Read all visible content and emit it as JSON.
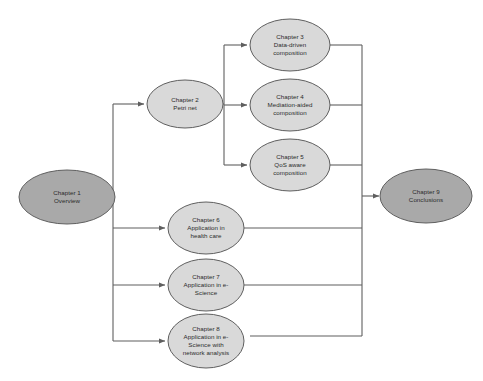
{
  "diagram": {
    "type": "flowchart",
    "background_color": "#ffffff",
    "line_color": "#5f5f5f",
    "text_color": "#2b2b2b",
    "colors": {
      "node_fill_dark": "#a9a9a9",
      "node_fill_light": "#d9d9d9",
      "node_stroke": "#5f5f5f"
    },
    "nodes": [
      {
        "id": "chapter-1",
        "lines": [
          "Chapter 1",
          "Overview"
        ],
        "fill": "#a9a9a9",
        "cx": 67,
        "cy": 197,
        "rx": 48,
        "ry": 27
      },
      {
        "id": "chapter-2",
        "lines": [
          "Chapter 2",
          "Petri net"
        ],
        "fill": "#d9d9d9",
        "cx": 185,
        "cy": 104,
        "rx": 38,
        "ry": 24
      },
      {
        "id": "chapter-3",
        "lines": [
          "Chapter 3",
          "Data-driven",
          "composition"
        ],
        "fill": "#d9d9d9",
        "cx": 290,
        "cy": 45,
        "rx": 40,
        "ry": 26
      },
      {
        "id": "chapter-4",
        "lines": [
          "Chapter 4",
          "Mediation-aided",
          "composition"
        ],
        "fill": "#d9d9d9",
        "cx": 290,
        "cy": 105,
        "rx": 40,
        "ry": 26
      },
      {
        "id": "chapter-5",
        "lines": [
          "Chapter 5",
          "QoS aware",
          "composition"
        ],
        "fill": "#d9d9d9",
        "cx": 290,
        "cy": 165,
        "rx": 40,
        "ry": 26
      },
      {
        "id": "chapter-6",
        "lines": [
          "Chapter 6",
          "Application in",
          "health care"
        ],
        "fill": "#d9d9d9",
        "cx": 206,
        "cy": 228,
        "rx": 38,
        "ry": 26
      },
      {
        "id": "chapter-7",
        "lines": [
          "Chapter 7",
          "Application in e-",
          "Science"
        ],
        "fill": "#d9d9d9",
        "cx": 206,
        "cy": 285,
        "rx": 38,
        "ry": 26
      },
      {
        "id": "chapter-8",
        "lines": [
          "Chapter 8",
          "Application in e-",
          "Science with",
          "network analysis"
        ],
        "fill": "#d9d9d9",
        "cx": 206,
        "cy": 341,
        "rx": 38,
        "ry": 27
      },
      {
        "id": "chapter-9",
        "lines": [
          "Chapter 9",
          "Conclusions"
        ],
        "fill": "#a9a9a9",
        "cx": 426,
        "cy": 196,
        "rx": 46,
        "ry": 27
      }
    ],
    "edges": [
      {
        "id": "edge-ch1-to-trunk",
        "from": "chapter-1",
        "to": "left-trunk"
      },
      {
        "id": "edge-trunk-to-ch2",
        "from": "left-trunk",
        "to": "chapter-2"
      },
      {
        "id": "edge-trunk-to-ch6",
        "from": "left-trunk",
        "to": "chapter-6"
      },
      {
        "id": "edge-trunk-to-ch7",
        "from": "left-trunk",
        "to": "chapter-7"
      },
      {
        "id": "edge-trunk-to-ch8",
        "from": "left-trunk",
        "to": "chapter-8"
      },
      {
        "id": "edge-ch2-to-ch3",
        "from": "chapter-2",
        "to": "chapter-3"
      },
      {
        "id": "edge-ch2-to-ch4",
        "from": "chapter-2",
        "to": "chapter-4"
      },
      {
        "id": "edge-ch2-to-ch5",
        "from": "chapter-2",
        "to": "chapter-5"
      },
      {
        "id": "edge-ch3-to-ch9",
        "from": "chapter-3",
        "to": "chapter-9"
      },
      {
        "id": "edge-ch4-to-ch9",
        "from": "chapter-4",
        "to": "chapter-9"
      },
      {
        "id": "edge-ch5-to-ch9",
        "from": "chapter-5",
        "to": "chapter-9"
      },
      {
        "id": "edge-ch6-to-ch9",
        "from": "chapter-6",
        "to": "chapter-9"
      },
      {
        "id": "edge-ch7-to-ch9",
        "from": "chapter-7",
        "to": "chapter-9"
      },
      {
        "id": "edge-ch8-to-ch9",
        "from": "chapter-8",
        "to": "chapter-9"
      }
    ]
  }
}
